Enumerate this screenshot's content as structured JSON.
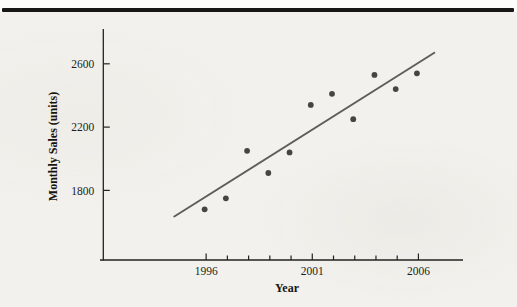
{
  "page": {
    "background_color": "#f2f1ed",
    "top_rule_color": "#171715"
  },
  "chart_data": {
    "type": "scatter",
    "title": "",
    "xlabel": "Year",
    "ylabel": "Monthly Sales (units)",
    "x": [
      1996,
      1997,
      1998,
      1999,
      2000,
      2001,
      2002,
      2003,
      2004,
      2005,
      2006
    ],
    "y": [
      1680,
      1750,
      2050,
      1910,
      2040,
      2340,
      2410,
      2250,
      2530,
      2440,
      2540
    ],
    "trend_line": {
      "x": [
        1994.5,
        2006.75
      ],
      "y": [
        1635,
        2670
      ]
    },
    "xlim": [
      1991,
      2008.1
    ],
    "ylim": [
      1360,
      2820
    ],
    "xticks": [
      1996,
      1997,
      1998,
      1999,
      2000,
      2001,
      2002,
      2003,
      2004,
      2005,
      2006
    ],
    "xtick_labels": [
      1996,
      2001,
      2006
    ],
    "yticks": [
      1800,
      2200,
      2600
    ],
    "grid": false,
    "legend": false,
    "point_color": "#46453f",
    "trend_color": "#5e5e58",
    "axis_color": "#23221e",
    "text_color": "#201f1b"
  }
}
